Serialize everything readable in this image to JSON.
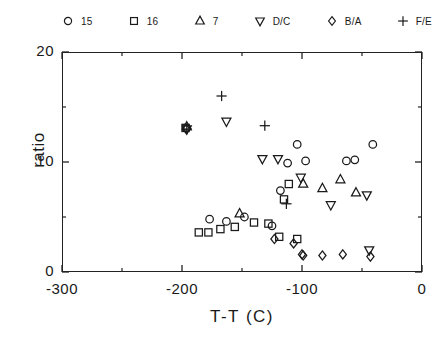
{
  "chart_data": {
    "type": "scatter",
    "title": "",
    "xlabel": "T-T (C)",
    "ylabel": "ratio",
    "xlim": [
      -300,
      0
    ],
    "ylim": [
      0,
      20
    ],
    "xticks": [
      -300,
      -200,
      -100,
      0
    ],
    "xtick_labels": [
      "-300",
      "-200",
      "-100",
      "0"
    ],
    "yticks": [
      0,
      10,
      20
    ],
    "ytick_labels": [
      "0",
      "10",
      "20"
    ],
    "yminor_ticks": [
      5,
      15
    ],
    "grid": false,
    "legend_position": "above-plot",
    "series": [
      {
        "name": "15",
        "marker": "circle",
        "points": [
          [
            -196.5,
            13.1
          ],
          [
            -177,
            4.8
          ],
          [
            -163,
            4.6
          ],
          [
            -148,
            5.0
          ],
          [
            -125,
            4.2
          ],
          [
            -118,
            7.4
          ],
          [
            -112,
            9.9
          ],
          [
            -104,
            11.6
          ],
          [
            -97,
            10.1
          ],
          [
            -63,
            10.1
          ],
          [
            -56,
            10.2
          ],
          [
            -41,
            11.6
          ]
        ]
      },
      {
        "name": "16",
        "marker": "square",
        "points": [
          [
            -197,
            13.1
          ],
          [
            -186,
            3.6
          ],
          [
            -178,
            3.6
          ],
          [
            -168,
            3.9
          ],
          [
            -156,
            4.1
          ],
          [
            -140,
            4.5
          ],
          [
            -128,
            4.4
          ],
          [
            -119,
            3.2
          ],
          [
            -115,
            6.6
          ],
          [
            -111,
            8.0
          ],
          [
            -104,
            3.0
          ]
        ]
      },
      {
        "name": "7",
        "marker": "triangle-up",
        "points": [
          [
            -196,
            13.2
          ],
          [
            -152,
            5.3
          ],
          [
            -99,
            8.0
          ],
          [
            -83,
            7.6
          ],
          [
            -68,
            8.4
          ],
          [
            -55,
            7.2
          ]
        ]
      },
      {
        "name": "D/C",
        "marker": "triangle-down",
        "points": [
          [
            -196,
            13.0
          ],
          [
            -163,
            13.7
          ],
          [
            -133,
            10.3
          ],
          [
            -120,
            10.3
          ],
          [
            -101,
            8.6
          ],
          [
            -76,
            6.1
          ],
          [
            -46,
            7.0
          ],
          [
            -44,
            2.0
          ]
        ]
      },
      {
        "name": "B/A",
        "marker": "diamond",
        "points": [
          [
            -196.5,
            13.0
          ],
          [
            -123,
            3.0
          ],
          [
            -107,
            2.6
          ],
          [
            -100,
            1.6
          ],
          [
            -99,
            1.5
          ],
          [
            -83,
            1.5
          ],
          [
            -66,
            1.6
          ],
          [
            -43,
            1.4
          ]
        ]
      },
      {
        "name": "F/E",
        "marker": "plus",
        "points": [
          [
            -196,
            13.0
          ],
          [
            -167,
            16.0
          ],
          [
            -131,
            13.3
          ],
          [
            -113,
            6.2
          ]
        ]
      }
    ]
  },
  "legend": {
    "items": [
      {
        "marker": "circle",
        "label": "15"
      },
      {
        "marker": "square",
        "label": "16"
      },
      {
        "marker": "triangle-up",
        "label": "7"
      },
      {
        "marker": "triangle-down",
        "label": "D/C"
      },
      {
        "marker": "diamond",
        "label": "B/A"
      },
      {
        "marker": "plus",
        "label": "F/E"
      }
    ]
  },
  "style": {
    "marker_color": "#1a1a1a",
    "axis_color": "#222222",
    "background": "#ffffff"
  }
}
